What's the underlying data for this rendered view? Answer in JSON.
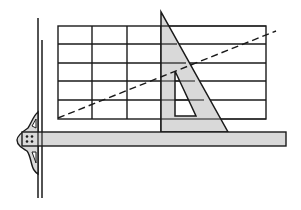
{
  "diagram": {
    "colors": {
      "ink": "#1a1a1a",
      "fill": "#d9d9d9",
      "background": "#ffffff"
    },
    "grid": {
      "x": 58,
      "y": 26,
      "width": 208,
      "height": 93,
      "columns_x": [
        92,
        127,
        161
      ],
      "rows_y": [
        44,
        63,
        81,
        100
      ]
    },
    "board_edge": {
      "x1": 38,
      "x2": 42,
      "y_top_outer": 18,
      "y_top_inner": 40,
      "y_bottom": 198
    },
    "t_square_blade": {
      "x": 22,
      "y": 132,
      "width": 264,
      "height": 14
    },
    "set_square": {
      "apex": [
        161,
        12
      ],
      "bottom_left": [
        161,
        132
      ],
      "bottom_right": [
        228,
        132
      ],
      "cutout": [
        [
          175,
          71
        ],
        [
          175,
          116
        ],
        [
          196,
          116
        ]
      ]
    },
    "dashed_line": {
      "from": [
        58,
        118
      ],
      "to": [
        276,
        31
      ]
    },
    "components": [
      "drawing-board-edge",
      "grid",
      "t-square",
      "set-square",
      "inclined-dashed-line"
    ]
  }
}
